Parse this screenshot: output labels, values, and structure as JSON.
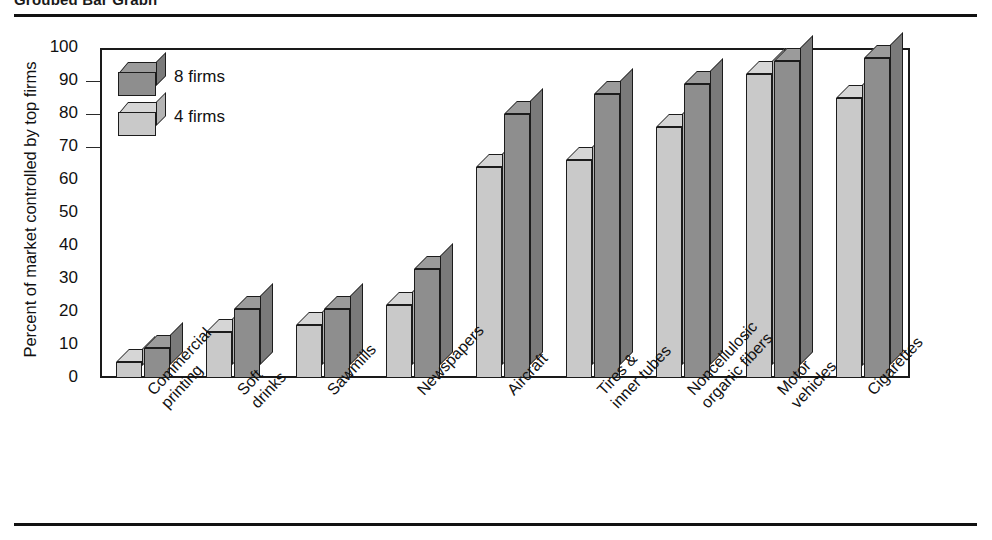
{
  "figure": {
    "title": "Grouped Bar Graph",
    "top_rule": true,
    "bottom_rule": true
  },
  "legend": {
    "position": "inside-top-left",
    "entries": [
      {
        "label": "8 firms",
        "series": "8 firms",
        "color": "#8e8e8e"
      },
      {
        "label": "4 firms",
        "series": "4 firms",
        "color": "#c9c9c9"
      }
    ]
  },
  "chart_data": {
    "type": "bar",
    "title": "Grouped Bar Graph",
    "xlabel": "",
    "ylabel": "Percent of market controlled by top firms",
    "ylim": [
      0,
      100
    ],
    "yticks": [
      0,
      10,
      20,
      30,
      40,
      50,
      60,
      70,
      80,
      90,
      100
    ],
    "ytick_labels": [
      "0",
      "10",
      "20",
      "30",
      "40",
      "50",
      "60",
      "70",
      "80",
      "90",
      "100"
    ],
    "grid": true,
    "legend_position": "upper left (inside plot)",
    "style": "3d-grouped-columns",
    "categories": [
      "Commercial printing",
      "Soft drinks",
      "Sawmills",
      "Newspapers",
      "Aircraft",
      "Tires & inner tubes",
      "Noncellulosic organic fibers",
      "Motor vehicles",
      "Cigarettes"
    ],
    "category_lines": [
      [
        "Commercial",
        "printing"
      ],
      [
        "Soft",
        "drinks"
      ],
      [
        "Sawmills"
      ],
      [
        "Newspapers"
      ],
      [
        "Aircraft"
      ],
      [
        "Tires &",
        "inner tubes"
      ],
      [
        "Noncellulosic",
        "organic fibers"
      ],
      [
        "Motor",
        "vehicles"
      ],
      [
        "Cigarettes"
      ]
    ],
    "series": [
      {
        "name": "4 firms",
        "color": "#c9c9c9",
        "values": [
          5,
          14,
          16,
          22,
          64,
          66,
          76,
          92,
          85
        ]
      },
      {
        "name": "8 firms",
        "color": "#8e8e8e",
        "values": [
          9,
          21,
          21,
          33,
          80,
          86,
          89,
          96,
          97
        ]
      }
    ]
  }
}
